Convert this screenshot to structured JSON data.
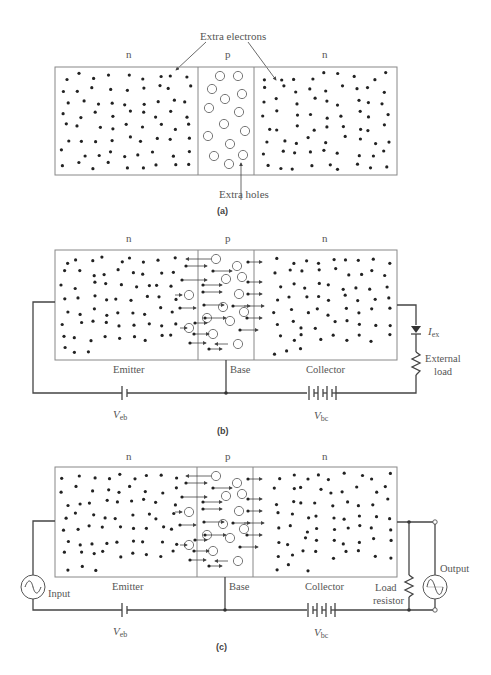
{
  "panels": {
    "a": {
      "caption": "(a)",
      "region_labels": [
        "n",
        "p",
        "n"
      ],
      "annotation_electrons": "Extra electrons",
      "annotation_holes": "Extra holes"
    },
    "b": {
      "caption": "(b)",
      "region_labels": [
        "n",
        "p",
        "n"
      ],
      "emitter": "Emitter",
      "base": "Base",
      "collector": "Collector",
      "veb_main": "V",
      "veb_sub": "eb",
      "vbc_main": "V",
      "vbc_sub": "bc",
      "iex_main": "I",
      "iex_sub": "ex",
      "load_line1": "External",
      "load_line2": "load"
    },
    "c": {
      "caption": "(c)",
      "region_labels": [
        "n",
        "p",
        "n"
      ],
      "emitter": "Emitter",
      "base": "Base",
      "collector": "Collector",
      "veb_main": "V",
      "veb_sub": "eb",
      "vbc_main": "V",
      "vbc_sub": "bc",
      "input": "Input",
      "output": "Output",
      "load_line1": "Load",
      "load_line2": "resistor"
    }
  },
  "colors": {
    "wire": "#444444",
    "box": "#888888",
    "text": "#555555"
  }
}
